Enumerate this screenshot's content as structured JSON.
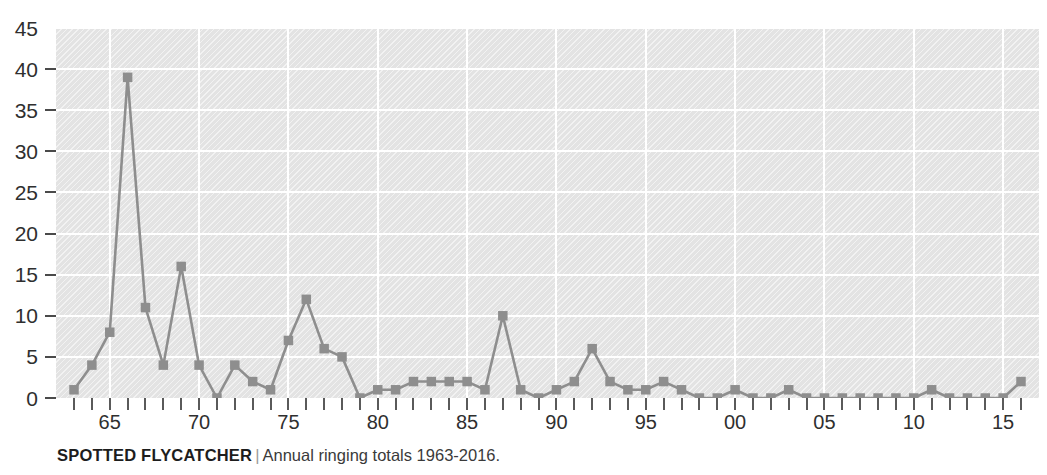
{
  "caption": {
    "title": "SPOTTED FLYCATCHER",
    "separator": "|",
    "subtitle": "Annual ringing totals 1963-2016."
  },
  "colors": {
    "plot_background": "#e3e3e3",
    "gridline": "#ffffff",
    "series_line": "#8e8e8e",
    "series_marker": "#8e8e8e",
    "axis_text": "#2f2f2f",
    "tick": "#5a5a5a",
    "caption_title": "#1d1d1d",
    "caption_separator": "#9a9a9a"
  },
  "chart_data": {
    "type": "line",
    "title": "SPOTTED FLYCATCHER",
    "subtitle": "Annual ringing totals 1963-2016.",
    "xlabel": "",
    "ylabel": "",
    "grid": true,
    "legend": "none",
    "marker": "square",
    "xlim": [
      1963,
      2016
    ],
    "ylim": [
      0,
      45
    ],
    "yticks": [
      0,
      5,
      10,
      15,
      20,
      25,
      30,
      35,
      40,
      45
    ],
    "ytick_labels": [
      "0",
      "5",
      "10",
      "15",
      "20",
      "25",
      "30",
      "35",
      "40",
      "45"
    ],
    "xticks": [
      1963,
      1964,
      1965,
      1966,
      1967,
      1968,
      1969,
      1970,
      1971,
      1972,
      1973,
      1974,
      1975,
      1976,
      1977,
      1978,
      1979,
      1980,
      1981,
      1982,
      1983,
      1984,
      1985,
      1986,
      1987,
      1988,
      1989,
      1990,
      1991,
      1992,
      1993,
      1994,
      1995,
      1996,
      1997,
      1998,
      1999,
      2000,
      2001,
      2002,
      2003,
      2004,
      2005,
      2006,
      2007,
      2008,
      2009,
      2010,
      2011,
      2012,
      2013,
      2014,
      2015,
      2016
    ],
    "xtick_labels": [
      {
        "x": 1965,
        "label": "65"
      },
      {
        "x": 1970,
        "label": "70"
      },
      {
        "x": 1975,
        "label": "75"
      },
      {
        "x": 1980,
        "label": "80"
      },
      {
        "x": 1985,
        "label": "85"
      },
      {
        "x": 1990,
        "label": "90"
      },
      {
        "x": 1995,
        "label": "95"
      },
      {
        "x": 2000,
        "label": "00"
      },
      {
        "x": 2005,
        "label": "05"
      },
      {
        "x": 2010,
        "label": "10"
      },
      {
        "x": 2015,
        "label": "15"
      }
    ],
    "x": [
      1963,
      1964,
      1965,
      1966,
      1967,
      1968,
      1969,
      1970,
      1971,
      1972,
      1973,
      1974,
      1975,
      1976,
      1977,
      1978,
      1979,
      1980,
      1981,
      1982,
      1983,
      1984,
      1985,
      1986,
      1987,
      1988,
      1989,
      1990,
      1991,
      1992,
      1993,
      1994,
      1995,
      1996,
      1997,
      1998,
      1999,
      2000,
      2001,
      2002,
      2003,
      2004,
      2005,
      2006,
      2007,
      2008,
      2009,
      2010,
      2011,
      2012,
      2013,
      2014,
      2015,
      2016
    ],
    "values": [
      1,
      4,
      8,
      39,
      11,
      4,
      16,
      4,
      0,
      4,
      2,
      1,
      7,
      12,
      6,
      5,
      0,
      1,
      1,
      2,
      2,
      2,
      2,
      1,
      10,
      1,
      0,
      1,
      2,
      6,
      2,
      1,
      1,
      2,
      1,
      0,
      0,
      1,
      0,
      0,
      1,
      0,
      0,
      0,
      0,
      0,
      0,
      0,
      1,
      0,
      0,
      0,
      0,
      2
    ],
    "series": [
      {
        "name": "Annual ringing totals",
        "values": [
          1,
          4,
          8,
          39,
          11,
          4,
          16,
          4,
          0,
          4,
          2,
          1,
          7,
          12,
          6,
          5,
          0,
          1,
          1,
          2,
          2,
          2,
          2,
          1,
          10,
          1,
          0,
          1,
          2,
          6,
          2,
          1,
          1,
          2,
          1,
          0,
          0,
          1,
          0,
          0,
          1,
          0,
          0,
          0,
          0,
          0,
          0,
          0,
          1,
          0,
          0,
          0,
          0,
          2
        ]
      }
    ]
  }
}
